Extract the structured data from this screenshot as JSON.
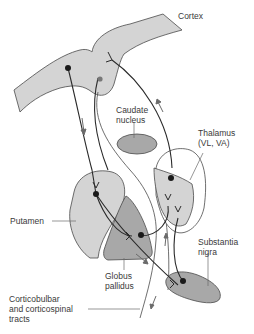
{
  "diagram": {
    "type": "anatomical-circuit",
    "colors": {
      "structure_light": "#d4d4d4",
      "structure_dark": "#a8a8a8",
      "outline": "#4a4a4a",
      "pathway": "#2a2a2a",
      "arrow": "#6a6a6a",
      "text": "#3a3a3a"
    },
    "labels": {
      "cortex": [
        "Cortex"
      ],
      "caudate": [
        "Caudate",
        "nucleus"
      ],
      "thalamus": [
        "Thalamus",
        "(VL, VA)"
      ],
      "putamen": [
        "Putamen"
      ],
      "globus": [
        "Globus",
        "pallidus"
      ],
      "substantia": [
        "Substantia",
        "nigra"
      ],
      "tracts": [
        "Corticobulbar",
        "and corticospinal",
        "tracts"
      ]
    }
  }
}
